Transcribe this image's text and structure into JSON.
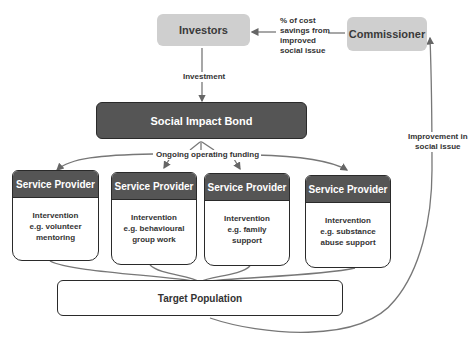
{
  "diagram": {
    "nodes": {
      "investors": "Investors",
      "commissioner": "Commissioner",
      "sib": "Social Impact Bond",
      "target": "Target Population"
    },
    "service_providers": [
      {
        "title": "Service Provider",
        "lines": [
          "Intervention",
          "e.g. volunteer",
          "mentoring"
        ]
      },
      {
        "title": "Service Provider",
        "lines": [
          "Intervention",
          "e.g. behavioural",
          "group work"
        ]
      },
      {
        "title": "Service Provider",
        "lines": [
          "Intervention",
          "e.g. family",
          "support"
        ]
      },
      {
        "title": "Service Provider",
        "lines": [
          "Intervention",
          "e.g. substance",
          "abuse support"
        ]
      }
    ],
    "edge_labels": {
      "savings": [
        "% of cost",
        "savings from",
        "improved",
        "social issue"
      ],
      "investment": "Investment",
      "funding": "Ongoing operating funding",
      "improvement": [
        "Improvement in",
        "social issue"
      ]
    },
    "colors": {
      "grey_node": "#cfcfcf",
      "dark_node": "#555555",
      "border": "#2a2a2a",
      "line": "#666666"
    }
  }
}
